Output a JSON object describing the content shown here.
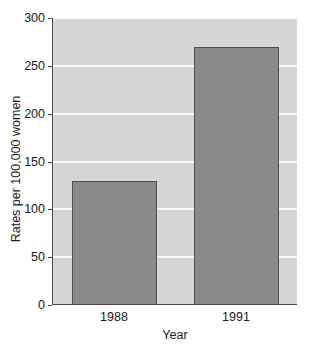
{
  "chart_data": {
    "type": "bar",
    "title": "",
    "categories": [
      "1988",
      "1991"
    ],
    "values": [
      130,
      270
    ],
    "xlabel": "Year",
    "ylabel": "Rates per 100,000 women",
    "ylim": [
      0,
      300
    ],
    "yticks": [
      0,
      50,
      100,
      150,
      200,
      250,
      300
    ],
    "ytick_labels": [
      "0",
      "50",
      "100",
      "150",
      "200",
      "250",
      "300"
    ],
    "grid": true,
    "legend": "none",
    "bar_color": "#8a8a8a",
    "bar_border_color": "#4f4f4f",
    "plot_background": "#d6d6d6",
    "gridline_color": "#fbfbfb",
    "axis_color": "#4a4a4a"
  },
  "axis_titles": {
    "y": "Rates per 100,000 women",
    "x": "Year"
  },
  "ticks": {
    "y": [
      "300",
      "250",
      "200",
      "150",
      "100",
      "50",
      "0"
    ],
    "x": [
      "1988",
      "1991"
    ]
  },
  "title": {
    "text": ""
  }
}
